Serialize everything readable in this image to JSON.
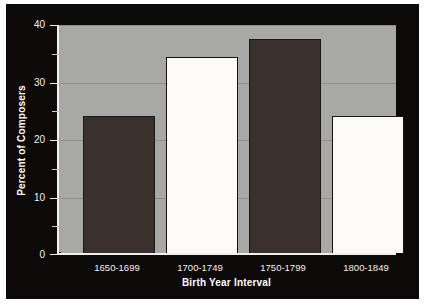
{
  "chart_data": {
    "type": "bar",
    "title": "",
    "categories": [
      "1650-1699",
      "1700-1749",
      "1750-1799",
      "1800-1849"
    ],
    "values": [
      24.0,
      34.4,
      37.6,
      24.0
    ],
    "series": [
      {
        "name": "Percent of Composers",
        "values": [
          24.0,
          34.4,
          37.6,
          24.0
        ]
      }
    ],
    "xlabel": "Birth Year Interval",
    "ylabel": "Percent of Composers",
    "ylim": [
      0,
      40
    ],
    "xlim_note": "categorical",
    "ytick_labels": [
      "0",
      "10",
      "20",
      "30",
      "40"
    ],
    "ytick_values": [
      0,
      10,
      20,
      30,
      40
    ],
    "yminor_tick_values": [
      5,
      15,
      25,
      35
    ],
    "grid": "horizontal-major-only",
    "legend": "none",
    "bar_colors": [
      "#3a302e",
      "#fbfaf7",
      "#3a302e",
      "#fbfaf7"
    ],
    "plot_background": "#a8a8a6",
    "figure_background": "#0d0908",
    "axis_color": "#f2f1ee",
    "gridline_color": "#8e8e8c",
    "text_color": "#f4f2ee"
  }
}
